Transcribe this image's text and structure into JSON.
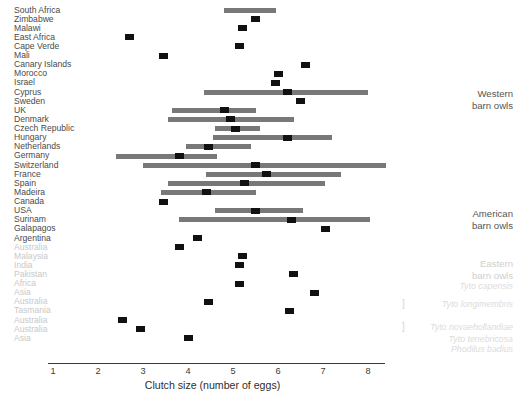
{
  "chart_data": {
    "type": "bar",
    "orientation": "horizontal-range",
    "title": "",
    "xlabel": "Clutch size (number of eggs)",
    "ylabel": "",
    "xlim": [
      1,
      8.6
    ],
    "xticks": [
      1,
      2,
      3,
      4,
      5,
      6,
      7,
      8
    ],
    "xticklabels": [
      "1",
      "2",
      "3",
      "4",
      "5",
      "6",
      "7",
      "8"
    ],
    "grid": false,
    "legend": "none",
    "colors": {
      "range_bar": "#787878",
      "point": "#111111",
      "label": "#4a4a4a",
      "faded_label": "#c9c9c9",
      "axis": "#3a3a3a"
    },
    "categories": [
      "South Africa",
      "Zimbabwe",
      "Malawi",
      "East Africa",
      "Cape Verde",
      "Mali",
      "Canary Islands",
      "Morocco",
      "Israel",
      "Cyprus",
      "Sweden",
      "UK",
      "Denmark",
      "Czech Republic",
      "Hungary",
      "Netherlands",
      "Germany",
      "Switzerland",
      "France",
      "Spain",
      "Madeira",
      "Canada",
      "USA",
      "Surinam",
      "Galapagos",
      "Argentina",
      "Australia",
      "Malaysia",
      "India",
      "Pakistan",
      "Africa",
      "Asia",
      "Australia",
      "Tasmania",
      "Australia",
      "Australia",
      "Asia"
    ],
    "rows": [
      {
        "label": "South Africa",
        "faded": false,
        "range": [
          4.8,
          5.95
        ],
        "mean": null
      },
      {
        "label": "Zimbabwe",
        "faded": false,
        "range": null,
        "mean": 5.5
      },
      {
        "label": "Malawi",
        "faded": false,
        "range": null,
        "mean": 5.2
      },
      {
        "label": "East Africa",
        "faded": false,
        "range": null,
        "mean": 2.7
      },
      {
        "label": "Cape Verde",
        "faded": false,
        "range": null,
        "mean": 5.15
      },
      {
        "label": "Mali",
        "faded": false,
        "range": null,
        "mean": 3.45
      },
      {
        "label": "Canary Islands",
        "faded": false,
        "range": null,
        "mean": 6.6
      },
      {
        "label": "Morocco",
        "faded": false,
        "range": null,
        "mean": 6.0
      },
      {
        "label": "Israel",
        "faded": false,
        "range": null,
        "mean": 5.95
      },
      {
        "label": "Cyprus",
        "faded": false,
        "range": [
          4.35,
          8.0
        ],
        "mean": 6.2
      },
      {
        "label": "Sweden",
        "faded": false,
        "range": null,
        "mean": 6.5
      },
      {
        "label": "UK",
        "faded": false,
        "range": [
          3.65,
          5.5
        ],
        "mean": 4.8
      },
      {
        "label": "Denmark",
        "faded": false,
        "range": [
          3.55,
          6.35
        ],
        "mean": 4.95
      },
      {
        "label": "Czech Republic",
        "faded": false,
        "range": [
          4.6,
          5.6
        ],
        "mean": 5.05
      },
      {
        "label": "Hungary",
        "faded": false,
        "range": [
          4.55,
          7.2
        ],
        "mean": 6.2
      },
      {
        "label": "Netherlands",
        "faded": false,
        "range": [
          3.95,
          5.4
        ],
        "mean": 4.45
      },
      {
        "label": "Germany",
        "faded": false,
        "range": [
          2.4,
          4.65
        ],
        "mean": 3.8
      },
      {
        "label": "Switzerland",
        "faded": false,
        "range": [
          3.0,
          8.4
        ],
        "mean": 5.5
      },
      {
        "label": "France",
        "faded": false,
        "range": [
          4.4,
          7.4
        ],
        "mean": 5.75
      },
      {
        "label": "Spain",
        "faded": false,
        "range": [
          3.55,
          7.05
        ],
        "mean": 5.25
      },
      {
        "label": "Madeira",
        "faded": false,
        "range": [
          3.4,
          5.5
        ],
        "mean": 4.4
      },
      {
        "label": "Canada",
        "faded": false,
        "range": null,
        "mean": 3.45
      },
      {
        "label": "USA",
        "faded": false,
        "range": [
          4.6,
          6.55
        ],
        "mean": 5.5
      },
      {
        "label": "Surinam",
        "faded": false,
        "range": [
          3.8,
          8.05
        ],
        "mean": 6.3
      },
      {
        "label": "Galapagos",
        "faded": false,
        "range": null,
        "mean": 7.05
      },
      {
        "label": "Argentina",
        "faded": false,
        "range": null,
        "mean": 4.2
      },
      {
        "label": "Australia",
        "faded": true,
        "range": null,
        "mean": 3.8
      },
      {
        "label": "Malaysia",
        "faded": true,
        "range": null,
        "mean": 5.2
      },
      {
        "label": "India",
        "faded": true,
        "range": null,
        "mean": 5.15
      },
      {
        "label": "Pakistan",
        "faded": true,
        "range": null,
        "mean": 6.35
      },
      {
        "label": "Africa",
        "faded": true,
        "range": null,
        "mean": 5.15
      },
      {
        "label": "Asia",
        "faded": true,
        "range": null,
        "mean": 6.8
      },
      {
        "label": "Australia",
        "faded": true,
        "range": null,
        "mean": 4.45
      },
      {
        "label": "Tasmania",
        "faded": true,
        "range": null,
        "mean": 6.25
      },
      {
        "label": "Australia",
        "faded": true,
        "range": null,
        "mean": 2.55
      },
      {
        "label": "Australia",
        "faded": true,
        "range": null,
        "mean": 2.95
      },
      {
        "label": "Asia",
        "faded": true,
        "range": null,
        "mean": 4.0
      }
    ]
  },
  "groups": [
    {
      "name": "western-barn-owls",
      "line1": "Western",
      "line2": "barn owls",
      "faded": false
    },
    {
      "name": "american-barn-owls",
      "line1": "American",
      "line2": "barn owls",
      "faded": false
    },
    {
      "name": "eastern-barn-owls",
      "line1": "Eastern",
      "line2": "barn owls",
      "faded": true
    }
  ],
  "species": [
    {
      "name": "tyto-capensis",
      "text": "Tyto capensis",
      "bracket": false
    },
    {
      "name": "tyto-longimembris",
      "text": "Tyto longimembris",
      "bracket": true
    },
    {
      "name": "tyto-novaehollandiae",
      "text": "Tyto novaehollandiae",
      "bracket": true
    },
    {
      "name": "tyto-tenebricosa",
      "text": "Tyto tenebricosa",
      "bracket": false
    },
    {
      "name": "phodilus-badius",
      "text": "Phodilus badius",
      "bracket": false
    }
  ],
  "bracket_glyph": "]"
}
